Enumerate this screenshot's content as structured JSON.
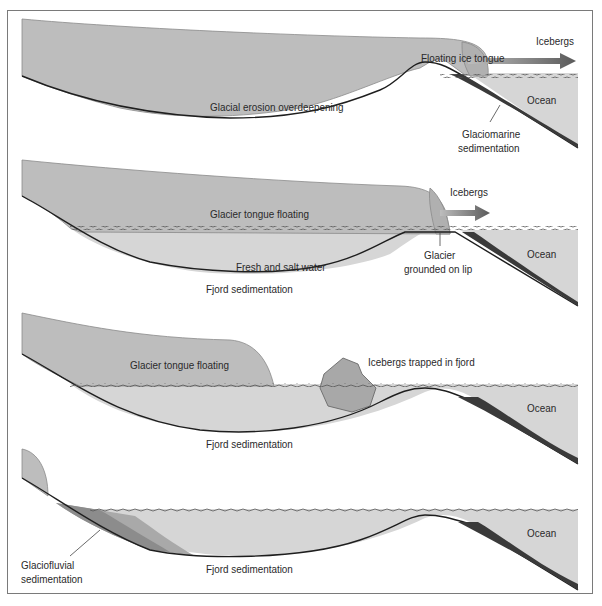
{
  "figure": {
    "panels": [
      {
        "id": "panel-1",
        "labels": {
          "floating_ice_tongue": "Floating ice tongue",
          "icebergs": "Icebergs",
          "glacial_erosion": "Glacial erosion overdeepening",
          "ocean": "Ocean",
          "glaciomarine_1": "Glaciomarine",
          "glaciomarine_2": "sedimentation"
        }
      },
      {
        "id": "panel-2",
        "labels": {
          "glacier_tongue_floating": "Glacier tongue floating",
          "icebergs": "Icebergs",
          "fresh_salt_water": "Fresh and salt water",
          "fjord_sedimentation": "Fjord sedimentation",
          "grounded_1": "Glacier",
          "grounded_2": "grounded on lip",
          "ocean": "Ocean"
        }
      },
      {
        "id": "panel-3",
        "labels": {
          "glacier_tongue_floating": "Glacier tongue floating",
          "icebergs_trapped": "Icebergs trapped in fjord",
          "fjord_sedimentation": "Fjord sedimentation",
          "ocean": "Ocean"
        }
      },
      {
        "id": "panel-4",
        "labels": {
          "glaciofluvial_1": "Glaciofluvial",
          "glaciofluvial_2": "sedimentation",
          "fjord_sedimentation": "Fjord sedimentation",
          "ocean": "Ocean"
        }
      }
    ],
    "colors": {
      "ice": "#bdbdbd",
      "ice_edge": "#8a8a8a",
      "water": "#d6d6d6",
      "sediment_dark": "#3a3a3a",
      "sediment_mid": "#8c8c8c",
      "sediment_light": "#a9a9a9",
      "bedrock_line": "#1e1e1e",
      "frame": "#7a7a7a",
      "text": "#2a2a2a"
    }
  }
}
